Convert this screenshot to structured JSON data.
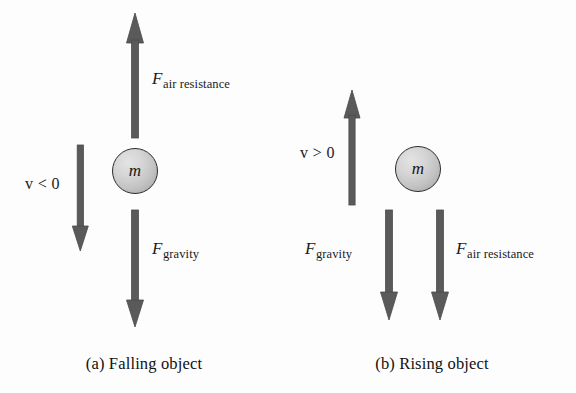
{
  "figure": {
    "background_color": "#fdfdfd",
    "arrow_color": "#5a5a5a",
    "arrow_outline_color": "#4a4a4a",
    "text_color": "#1a1a1a",
    "mass_fill_light": "#e3e3e3",
    "mass_fill_dark": "#9e9e9e",
    "mass_border_color": "#2b2b2b"
  },
  "panels": [
    {
      "id": "a",
      "caption": "(a)  Falling object",
      "mass_label": "m",
      "velocity": {
        "name": "velocity-indicator",
        "symbol": "v",
        "relation": "< 0",
        "text": "v < 0",
        "direction": "down"
      },
      "forces": [
        {
          "name": "air-resistance",
          "symbol": "F",
          "subscript": "air resistance",
          "direction": "up"
        },
        {
          "name": "gravity",
          "symbol": "F",
          "subscript": "gravity",
          "direction": "down"
        }
      ]
    },
    {
      "id": "b",
      "caption": "(b)  Rising object",
      "mass_label": "m",
      "velocity": {
        "name": "velocity-indicator",
        "symbol": "v",
        "relation": "> 0",
        "text": "v > 0",
        "direction": "up"
      },
      "forces": [
        {
          "name": "gravity",
          "symbol": "F",
          "subscript": "gravity",
          "direction": "down"
        },
        {
          "name": "air-resistance",
          "symbol": "F",
          "subscript": "air resistance",
          "direction": "down"
        }
      ]
    }
  ]
}
